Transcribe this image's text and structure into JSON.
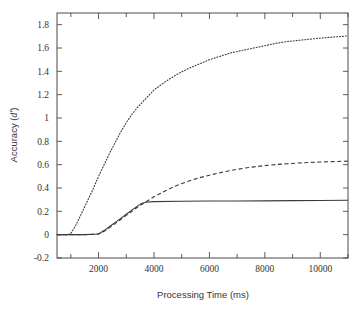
{
  "chart_data": {
    "type": "line",
    "title": "",
    "xlabel": "Processing Time (ms)",
    "ylabel_prefix": "Accuracy (",
    "ylabel_symbol": "d′",
    "ylabel_suffix": ")",
    "ylabel_full": "Accuracy (d′)",
    "xlim": [
      500,
      11000
    ],
    "ylim": [
      -0.2,
      1.9
    ],
    "grid": false,
    "legend": "none",
    "x_ticks_major": [
      2000,
      4000,
      6000,
      8000,
      10000
    ],
    "x_tick_labels": [
      "2000",
      "4000",
      "6000",
      "8000",
      "10000"
    ],
    "x_ticks_minor": [
      1000,
      3000,
      5000,
      7000,
      9000,
      11000
    ],
    "y_ticks": [
      -0.2,
      0,
      0.2,
      0.4,
      0.6,
      0.8,
      1,
      1.2,
      1.4,
      1.6,
      1.8
    ],
    "y_tick_labels": [
      "-0.2",
      "0",
      "0.2",
      "0.4",
      "0.6",
      "0.8",
      "1",
      "1.2",
      "1.4",
      "1.6",
      "1.8"
    ],
    "series": [
      {
        "name": "dotted-curve",
        "style": "dotted",
        "color": "#3a3a3a",
        "x": [
          500,
          900,
          1000,
          1200,
          1400,
          1600,
          1800,
          2000,
          2200,
          2400,
          2600,
          2800,
          3000,
          3200,
          3400,
          3600,
          3800,
          4000,
          4400,
          4800,
          5200,
          5600,
          6000,
          6400,
          6800,
          7200,
          7600,
          8000,
          8400,
          8800,
          9200,
          9600,
          10000,
          10400,
          10800,
          11000
        ],
        "y": [
          0,
          0,
          0.01,
          0.09,
          0.19,
          0.29,
          0.39,
          0.5,
          0.6,
          0.7,
          0.79,
          0.88,
          0.96,
          1.03,
          1.09,
          1.14,
          1.19,
          1.24,
          1.31,
          1.37,
          1.42,
          1.46,
          1.5,
          1.53,
          1.56,
          1.58,
          1.6,
          1.62,
          1.64,
          1.655,
          1.665,
          1.675,
          1.685,
          1.693,
          1.7,
          1.705
        ]
      },
      {
        "name": "dashed-curve",
        "style": "dashed",
        "color": "#3a3a3a",
        "x": [
          500,
          1500,
          2000,
          2200,
          2400,
          2600,
          2800,
          3000,
          3200,
          3400,
          3600,
          3800,
          4000,
          4400,
          4800,
          5200,
          5600,
          6000,
          6400,
          6800,
          7200,
          7600,
          8000,
          8400,
          8800,
          9200,
          9600,
          10000,
          10400,
          10800,
          11000
        ],
        "y": [
          0,
          0,
          0.005,
          0.03,
          0.06,
          0.095,
          0.13,
          0.165,
          0.2,
          0.235,
          0.265,
          0.295,
          0.325,
          0.375,
          0.42,
          0.455,
          0.485,
          0.51,
          0.532,
          0.552,
          0.568,
          0.581,
          0.592,
          0.601,
          0.608,
          0.614,
          0.619,
          0.623,
          0.626,
          0.629,
          0.63
        ]
      },
      {
        "name": "solid-curve",
        "style": "solid",
        "color": "#3a3a3a",
        "x": [
          500,
          1500,
          2000,
          2200,
          2400,
          2600,
          2800,
          3000,
          3200,
          3400,
          3550,
          3700,
          4000,
          5000,
          6000,
          7000,
          8000,
          9000,
          10000,
          11000
        ],
        "y": [
          0,
          0,
          0.005,
          0.035,
          0.07,
          0.105,
          0.14,
          0.175,
          0.21,
          0.245,
          0.268,
          0.278,
          0.283,
          0.286,
          0.288,
          0.289,
          0.29,
          0.292,
          0.293,
          0.295
        ]
      }
    ]
  }
}
